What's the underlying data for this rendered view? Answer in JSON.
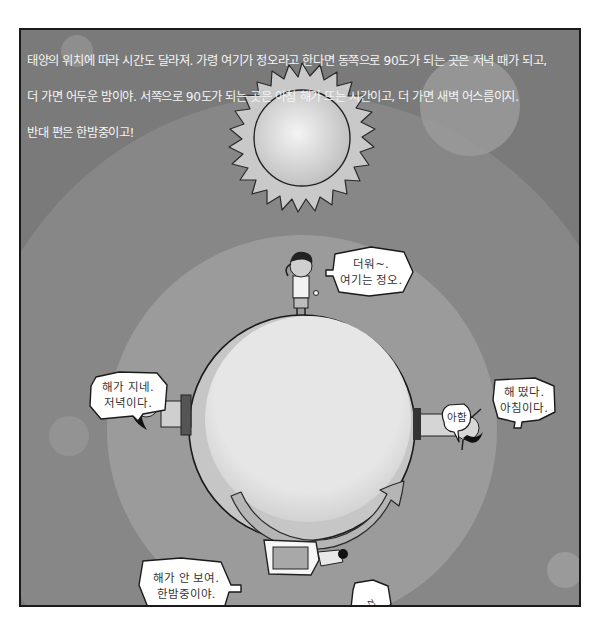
{
  "caption": {
    "lines": [
      "태양의 위치에 따라 시간도 달라져. 가령 여기가 정오라고 한다면 동쪽으로 90도가 되는 곳은 저녁 때가 되고,",
      "더 가면 어두운 밤이야. 서쪽으로 90도가 되는 곳은 아침 해가 뜨는 시간이고, 더 가면 새벽 어스름이지.",
      "반대 편은 한밤중이고!"
    ]
  },
  "scene": {
    "sun_icon": "sun",
    "earth_icon": "globe",
    "rotation_arrow_icon": "curved-arrow-counterclockwise",
    "colors": {
      "panel_bg": "#7a7a7a",
      "outer_halo": "#8a8a8a",
      "inner_halo": "#9c9c9c",
      "earth": "#e4e4e4",
      "earth_shadow": "#c8c8c8",
      "sun": "#e8e8e8",
      "bubble": "#ffffff",
      "outline": "#1a1a1a"
    }
  },
  "bubbles": {
    "noon": "더워~.\n여기는 정오.",
    "evening": "해가 지네.\n저녁이다.",
    "morning": "해 떴다.\n아침이다.",
    "yawn": "아함",
    "midnight": "해가 안 보여.\n한밤중이야.",
    "snore": "zzz"
  },
  "characters": [
    {
      "position": "top",
      "label": "noon"
    },
    {
      "position": "left",
      "label": "evening"
    },
    {
      "position": "right",
      "label": "morning"
    },
    {
      "position": "bottom",
      "label": "midnight"
    }
  ]
}
